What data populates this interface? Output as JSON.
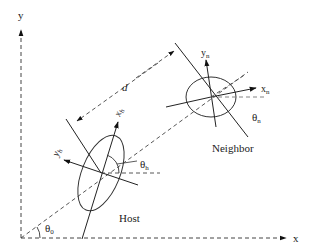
{
  "diagram": {
    "axes": {
      "x_label": "x",
      "y_label": "y"
    },
    "angles": {
      "global": "θ",
      "global_sub": "0",
      "host": "θ",
      "host_sub": "h",
      "neighbor": "θ",
      "neighbor_sub": "n"
    },
    "host": {
      "label": "Host",
      "x_axis_label": "x",
      "x_axis_sub": "h",
      "y_axis_label": "y",
      "y_axis_sub": "h"
    },
    "neighbor": {
      "label": "Neighbor",
      "x_axis_label": "x",
      "x_axis_sub": "n",
      "y_axis_label": "y",
      "y_axis_sub": "n"
    },
    "distance": {
      "label": "d"
    },
    "colors": {
      "stroke": "#222222",
      "dash": "#555555",
      "background": "#ffffff"
    }
  }
}
